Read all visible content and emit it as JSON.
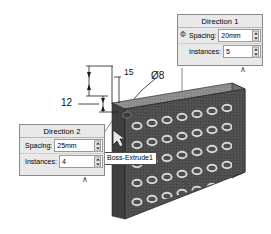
{
  "app": {
    "title": "Linear Pattern",
    "background": "#ffffff"
  },
  "model": {
    "name": "perforated-plate",
    "description": "Isometric dark gray plate with rectangular array of through holes",
    "face_color": "#4a4a4a",
    "top_face_color": "#8e8e8e",
    "side_face_color": "#6b6b6b",
    "hole_color": "#d8d8d8",
    "hole_rows": 5,
    "hole_columns": 8
  },
  "dimensions": [
    {
      "id": "hole-pitch",
      "label": "15"
    },
    {
      "id": "hole-diameter",
      "label": "Ø8"
    },
    {
      "id": "edge-offset",
      "label": "12"
    }
  ],
  "tooltip": {
    "label": "Boss-Extrude1"
  },
  "direction1": {
    "title": "Direction 1",
    "spacing_label": "Spacing:",
    "spacing_value": "20mm",
    "instances_label": "Instances:",
    "instances_value": "5",
    "chevron": "∧",
    "reverse_icon": "⥁"
  },
  "direction2": {
    "title": "Direction 2",
    "spacing_label": "Spacing:",
    "spacing_value": "25mm",
    "instances_label": "Instances:",
    "instances_value": "4",
    "chevron": "∧",
    "reverse_icon": "⥁"
  },
  "cursor": {
    "name": "mouse-pointer"
  }
}
